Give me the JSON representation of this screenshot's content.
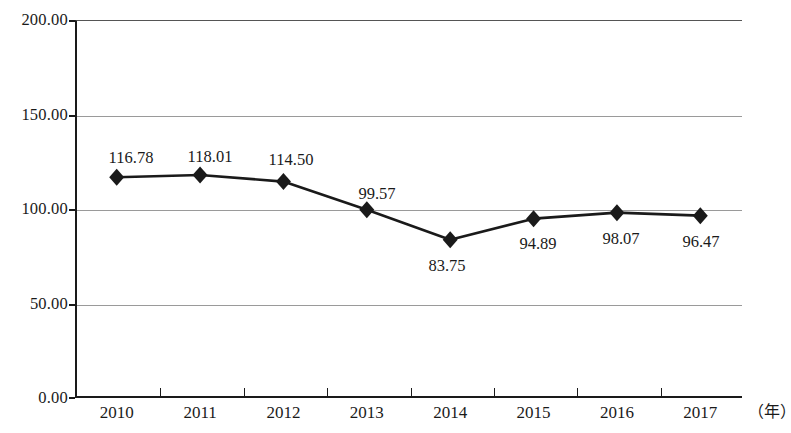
{
  "chart_data": {
    "type": "line",
    "title": "",
    "subtitle": "",
    "xlabel": "（年）",
    "ylabel": "",
    "categories": [
      "2010",
      "2011",
      "2012",
      "2013",
      "2014",
      "2015",
      "2016",
      "2017"
    ],
    "values": [
      116.78,
      118.01,
      114.5,
      99.57,
      83.75,
      94.89,
      98.07,
      96.47
    ],
    "point_labels": [
      "116.78",
      "118.01",
      "114.50",
      "99.57",
      "83.75",
      "94.89",
      "98.07",
      "96.47"
    ],
    "label_positions": [
      "above",
      "above",
      "above",
      "above",
      "below",
      "below",
      "below",
      "below"
    ],
    "ylim": [
      0,
      200
    ],
    "xlim": [
      0,
      8
    ],
    "y_ticks": [
      0,
      50,
      100,
      150,
      200
    ],
    "y_tick_labels": [
      "0.00",
      "50.00",
      "100.00",
      "150.00",
      "200.00"
    ],
    "grid": true,
    "grid_axis": "y",
    "legend": false,
    "legend_position": "none",
    "marker": "diamond",
    "series": [
      {
        "name": "",
        "values": [
          116.78,
          118.01,
          114.5,
          99.57,
          83.75,
          94.89,
          98.07,
          96.47
        ]
      }
    ]
  },
  "style": {
    "line_color": "#1a1a1a",
    "marker_color": "#1a1a1a",
    "grid_color": "#9a9a9a",
    "axis_color": "#1a1a1a",
    "background_color": "#ffffff",
    "text_color": "#1a1a1a"
  }
}
